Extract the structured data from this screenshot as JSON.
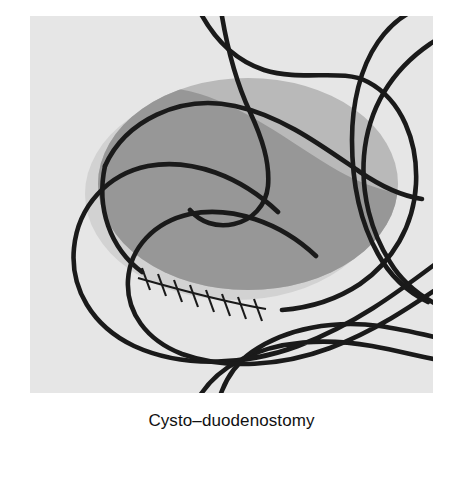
{
  "figure": {
    "caption": "Cysto–duodenostomy",
    "panel_background_color": "#e6e6e6",
    "page_background_color": "#ffffff",
    "line_color": "#1a1a1a",
    "anatomy_labels": {
      "stomach": "stomach",
      "esophagus": "esophagus",
      "duodenum": "duodenum",
      "jejunum": "jejunum",
      "pancreatic_pseudocyst": "pancreatic-pseudocyst",
      "cyst_shadow": "cyst-shadow",
      "cyst_upper_wall": "cyst-upper-wall",
      "cyst_cavity": "cyst-cavity",
      "anastomosis_rim": "anastomosis-rim",
      "suture_line": "suture-line"
    },
    "colors": {
      "cyst_upper": "#b9b9b9",
      "cyst_lower": "#979797",
      "cyst_shadow": "#d2d2d2",
      "outline": "#1a1a1a"
    },
    "suture_count": 8
  }
}
